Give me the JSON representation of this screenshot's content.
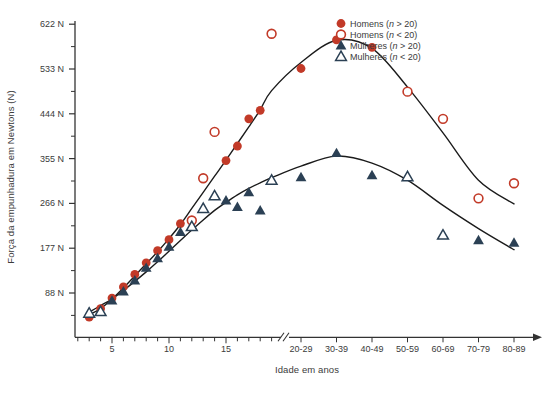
{
  "figure": {
    "background": "#ffffff"
  },
  "colors": {
    "men": "#c23a28",
    "women": "#2b4054",
    "curve": "#1b1b1b",
    "axis": "#333333",
    "text": "#3b3b3b"
  },
  "legend": {
    "position": "top-right",
    "items": [
      {
        "label": "Homens (n > 20)",
        "pre": "Homens (",
        "var": "n",
        "post": " > 20)",
        "marker": "circle-filled",
        "color": "#c23a28"
      },
      {
        "label": "Homens (n < 20)",
        "pre": "Homens (",
        "var": "n",
        "post": " < 20)",
        "marker": "circle-open",
        "color": "#c23a28"
      },
      {
        "label": "Mulheres (n > 20)",
        "pre": "Mulheres (",
        "var": "n",
        "post": " > 20)",
        "marker": "triangle-filled",
        "color": "#2b4054"
      },
      {
        "label": "Mulheres (n < 20)",
        "pre": "Mulheres (",
        "var": "n",
        "post": " < 20)",
        "marker": "triangle-open",
        "color": "#2b4054"
      }
    ]
  },
  "chart_data": {
    "type": "scatter",
    "title": "",
    "xlabel": "Idade em anos",
    "ylabel": "Força da empunhadura em Newtons (N)",
    "grid": false,
    "legend_position": "top-right",
    "ylim": [
      0,
      660
    ],
    "y_tick_values": [
      88,
      177,
      266,
      355,
      444,
      533,
      622
    ],
    "y_tick_labels": [
      "88 N",
      "177 N",
      "266 N",
      "355 N",
      "444 N",
      "533 N",
      "622 N"
    ],
    "x_year_range": [
      2,
      19
    ],
    "x_year_ticks_labeled": [
      5,
      10,
      15
    ],
    "x_ticks_decades": [
      "20-29",
      "30-39",
      "40-49",
      "50-59",
      "60-69",
      "70-79",
      "80-89"
    ],
    "axis_break_after_age": 19,
    "units": "Newtons (N)",
    "series": [
      {
        "name": "Homens (n > 20)",
        "marker": "circle",
        "fill": "filled",
        "color": "#c23a28",
        "points": [
          [
            3,
            40
          ],
          [
            4,
            57
          ],
          [
            5,
            78
          ],
          [
            6,
            100
          ],
          [
            7,
            125
          ],
          [
            8,
            148
          ],
          [
            9,
            172
          ],
          [
            10,
            194
          ],
          [
            11,
            226
          ],
          [
            15,
            351
          ],
          [
            16,
            380
          ],
          [
            17,
            434
          ],
          [
            18,
            451
          ],
          [
            "20-29",
            534
          ],
          [
            "30-39",
            591
          ],
          [
            "40-49",
            576
          ]
        ]
      },
      {
        "name": "Homens (n < 20)",
        "marker": "circle",
        "fill": "open",
        "color": "#c23a28",
        "points": [
          [
            12,
            232
          ],
          [
            13,
            316
          ],
          [
            14,
            408
          ],
          [
            19,
            603
          ],
          [
            "50-59",
            488
          ],
          [
            "60-69",
            434
          ],
          [
            "70-79",
            276
          ],
          [
            "80-89",
            306
          ]
        ]
      },
      {
        "name": "Mulheres (n > 20)",
        "marker": "triangle",
        "fill": "filled",
        "color": "#2b4054",
        "points": [
          [
            5,
            73
          ],
          [
            6,
            91
          ],
          [
            7,
            113
          ],
          [
            8,
            138
          ],
          [
            9,
            157
          ],
          [
            10,
            180
          ],
          [
            11,
            209
          ],
          [
            15,
            272
          ],
          [
            16,
            259
          ],
          [
            17,
            288
          ],
          [
            18,
            252
          ],
          [
            "20-29",
            318
          ],
          [
            "30-39",
            366
          ],
          [
            "40-49",
            322
          ],
          [
            "70-79",
            193
          ],
          [
            "80-89",
            188
          ]
        ]
      },
      {
        "name": "Mulheres (n < 20)",
        "marker": "triangle",
        "fill": "open",
        "color": "#2b4054",
        "points": [
          [
            3,
            48
          ],
          [
            4,
            51
          ],
          [
            12,
            220
          ],
          [
            13,
            256
          ],
          [
            14,
            281
          ],
          [
            19,
            312
          ],
          [
            "50-59",
            319
          ],
          [
            "60-69",
            203
          ]
        ]
      }
    ],
    "fit_curves": [
      {
        "name": "Homens",
        "points": [
          [
            3,
            45
          ],
          [
            4,
            57
          ],
          [
            5,
            76
          ],
          [
            6,
            98
          ],
          [
            7,
            122
          ],
          [
            8,
            146
          ],
          [
            9,
            170
          ],
          [
            10,
            196
          ],
          [
            11,
            224
          ],
          [
            12,
            256
          ],
          [
            13,
            288
          ],
          [
            14,
            320
          ],
          [
            15,
            352
          ],
          [
            16,
            385
          ],
          [
            17,
            418
          ],
          [
            18,
            452
          ],
          [
            19,
            490
          ],
          [
            "20-29",
            546
          ],
          [
            "30-39",
            590
          ],
          [
            "40-49",
            574
          ],
          [
            "50-59",
            497
          ],
          [
            "60-69",
            406
          ],
          [
            "70-79",
            312
          ],
          [
            "80-89",
            265
          ]
        ]
      },
      {
        "name": "Mulheres",
        "points": [
          [
            3,
            50
          ],
          [
            4,
            63
          ],
          [
            5,
            76
          ],
          [
            6,
            93
          ],
          [
            7,
            111
          ],
          [
            8,
            130
          ],
          [
            9,
            150
          ],
          [
            10,
            171
          ],
          [
            11,
            192
          ],
          [
            12,
            213
          ],
          [
            13,
            233
          ],
          [
            14,
            252
          ],
          [
            15,
            268
          ],
          [
            16,
            283
          ],
          [
            17,
            296
          ],
          [
            18,
            307
          ],
          [
            19,
            317
          ],
          [
            "20-29",
            340
          ],
          [
            "30-39",
            360
          ],
          [
            "40-49",
            346
          ],
          [
            "50-59",
            312
          ],
          [
            "60-69",
            262
          ],
          [
            "70-79",
            216
          ],
          [
            "80-89",
            174
          ]
        ]
      }
    ]
  }
}
